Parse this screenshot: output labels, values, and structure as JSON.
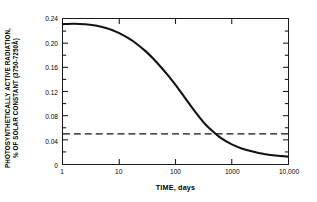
{
  "chart_data": {
    "type": "line",
    "title": "",
    "subtitle": "",
    "xlabel": "TIME, days",
    "ylabel_line1": "PHOTOSYNTHETICALLY ACTIVE RADIATION,",
    "ylabel_line2": "% OF SOLAR CONSTANT (3750-7250Å)",
    "xscale": "log",
    "yscale": "linear",
    "xlim": [
      1,
      10000
    ],
    "ylim": [
      0,
      0.24
    ],
    "grid": false,
    "legend": "none",
    "xticks": [
      1,
      10,
      100,
      1000,
      10000
    ],
    "xtick_labels": [
      "1",
      "10",
      "100",
      "1000",
      "10,000"
    ],
    "yticks": [
      0,
      0.02,
      0.04,
      0.06,
      0.08,
      0.1,
      0.12,
      0.14,
      0.16,
      0.18,
      0.2,
      0.22,
      0.24
    ],
    "ytick_labels": [
      "0",
      "",
      "0.04",
      "",
      "0.08",
      "",
      "0.12",
      "",
      "0.16",
      "",
      "0.20",
      "",
      "0.24"
    ],
    "ytick_labeled": [
      {
        "value": 0,
        "label": "0"
      },
      {
        "value": 0.04,
        "label": "0.04"
      },
      {
        "value": 0.08,
        "label": "0.08"
      },
      {
        "value": 0.12,
        "label": "0.12"
      },
      {
        "value": 0.16,
        "label": "0.16"
      },
      {
        "value": 0.2,
        "label": "0.20"
      },
      {
        "value": 0.24,
        "label": "0.24"
      }
    ],
    "series": [
      {
        "name": "photosynthetically active radiation",
        "style": "solid",
        "color": "#111111",
        "linewidth": 2.1,
        "x": [
          1,
          1.5,
          2,
          3,
          4,
          6,
          8,
          10,
          15,
          20,
          30,
          40,
          60,
          80,
          100,
          150,
          200,
          300,
          400,
          600,
          800,
          1000,
          1500,
          2000,
          3000,
          4000,
          6000,
          8000,
          10000
        ],
        "y": [
          0.2315,
          0.232,
          0.2318,
          0.2305,
          0.2288,
          0.2248,
          0.2205,
          0.2165,
          0.2075,
          0.1995,
          0.186,
          0.1745,
          0.1565,
          0.1425,
          0.131,
          0.1085,
          0.0925,
          0.0715,
          0.059,
          0.045,
          0.0375,
          0.0325,
          0.0258,
          0.0222,
          0.0182,
          0.0162,
          0.0141,
          0.013,
          0.0122
        ]
      },
      {
        "name": "compensation threshold",
        "style": "dashed",
        "color": "#111111",
        "linewidth": 1.3,
        "x": [
          1,
          10000
        ],
        "y": [
          0.05,
          0.05
        ]
      }
    ],
    "annotations": []
  }
}
